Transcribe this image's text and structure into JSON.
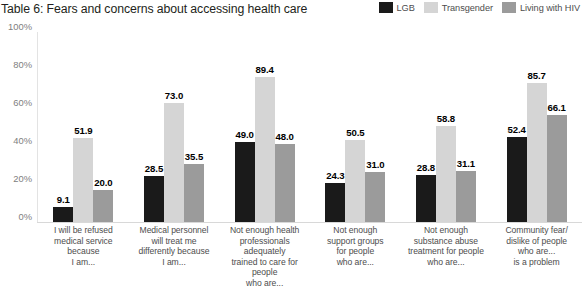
{
  "header": {
    "title": "Table 6: Fears and concerns about accessing health care"
  },
  "legend": {
    "items": [
      {
        "label": "LGB",
        "color": "#1a1a1a"
      },
      {
        "label": "Transgender",
        "color": "#d5d5d5"
      },
      {
        "label": "Living with HIV",
        "color": "#9b9b9b"
      }
    ]
  },
  "axis": {
    "yticks": [
      "0%",
      "20%",
      "40%",
      "60%",
      "80%",
      "100%"
    ]
  },
  "chart_data": {
    "type": "bar",
    "title": "Table 6: Fears and concerns about accessing health care",
    "xlabel": "",
    "ylabel": "",
    "ylim": [
      0,
      100
    ],
    "ytick_labels": [
      "0%",
      "20%",
      "40%",
      "60%",
      "80%",
      "100%"
    ],
    "ytick_values": [
      0,
      20,
      40,
      60,
      80,
      100
    ],
    "grid": false,
    "legend_position": "top-right",
    "categories": [
      "I will be refused medical service because I am...",
      "Medical personnel will treat me differently because I am...",
      "Not enough health professionals adequately trained to care for people who are...",
      "Not enough support groups for people who are...",
      "Not enough substance abuse treatment for people who are...",
      "Community fear/ dislike of people who are... is a problem"
    ],
    "category_lines": [
      [
        "I will be refused",
        "medical service",
        "because",
        "I am..."
      ],
      [
        "Medical personnel",
        "will treat me",
        "differently because",
        "I am..."
      ],
      [
        "Not enough health",
        "professionals adequately",
        "trained to care for people",
        "who are..."
      ],
      [
        "Not enough",
        "support groups",
        "for people",
        "who are..."
      ],
      [
        "Not enough",
        "substance abuse",
        "treatment for people",
        "who are..."
      ],
      [
        "Community fear/",
        "dislike of people",
        "who are...",
        "is a problem"
      ]
    ],
    "series": [
      {
        "name": "LGB",
        "color": "#1a1a1a",
        "values": [
          9.1,
          28.5,
          49.0,
          24.3,
          28.8,
          52.4
        ],
        "labels": [
          "9.1",
          "28.5",
          "49.0",
          "24.3",
          "28.8",
          "52.4"
        ]
      },
      {
        "name": "Transgender",
        "color": "#d5d5d5",
        "values": [
          51.9,
          73.0,
          89.4,
          50.5,
          58.8,
          85.7
        ],
        "labels": [
          "51.9",
          "73.0",
          "89.4",
          "50.5",
          "58.8",
          "85.7"
        ]
      },
      {
        "name": "Living with HIV",
        "color": "#9b9b9b",
        "values": [
          20.0,
          35.5,
          48.0,
          31.0,
          31.1,
          66.1
        ],
        "labels": [
          "20.0",
          "35.5",
          "48.0",
          "31.0",
          "31.1",
          "66.1"
        ]
      }
    ]
  }
}
